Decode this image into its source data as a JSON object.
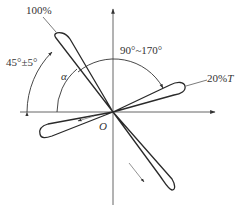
{
  "diagram": {
    "type": "polar-lobe-diagram",
    "origin_label": "O",
    "angle_symbol": "α",
    "labels": {
      "lobe_main": "100%",
      "lobe_secondary_value": "20%",
      "lobe_secondary_unit": "T",
      "angle_main": "45°±5°",
      "angle_between": "90°~170°"
    },
    "lobes": [
      {
        "name": "main-lobe",
        "label": "100%",
        "direction": "upper-left"
      },
      {
        "name": "secondary-lobe",
        "label": "20%T",
        "direction": "right"
      },
      {
        "name": "left-lobe",
        "label": "",
        "direction": "left-lower"
      },
      {
        "name": "bottom-lobe",
        "label": "",
        "direction": "lower-right"
      }
    ],
    "colors": {
      "stroke": "#2a2a2a",
      "background": "#ffffff"
    }
  }
}
